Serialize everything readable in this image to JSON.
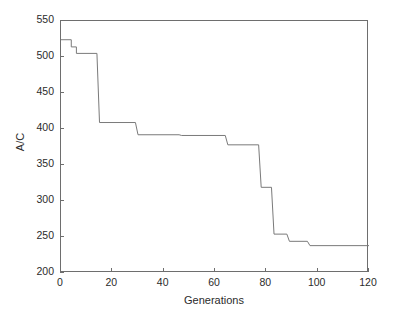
{
  "chart_data": {
    "type": "line",
    "title": "",
    "xlabel": "Generations",
    "ylabel": "A/C",
    "xlim": [
      0,
      120
    ],
    "ylim": [
      200,
      550
    ],
    "xticks": [
      0,
      20,
      40,
      60,
      80,
      100,
      120
    ],
    "yticks": [
      200,
      250,
      300,
      350,
      400,
      450,
      500,
      550
    ],
    "grid": false,
    "legend": null,
    "line_color": "#7a7a7a",
    "axis_color": "#6e6e6e",
    "background_color": "#ffffff",
    "step_style": "post",
    "series": [
      {
        "name": "Best A/C per generation",
        "x": [
          0,
          4,
          4,
          6,
          6,
          14,
          14,
          15,
          15,
          29,
          29,
          30,
          30,
          46,
          46,
          47,
          47,
          64,
          64,
          65,
          65,
          77,
          77,
          78,
          78,
          82,
          82,
          83,
          83,
          88,
          88,
          89,
          89,
          96,
          96,
          97,
          97,
          120
        ],
        "y": [
          524,
          524,
          514,
          514,
          505,
          505,
          505,
          409,
          409,
          409,
          409,
          392,
          392,
          392,
          392,
          391,
          391,
          391,
          391,
          378,
          378,
          378,
          378,
          319,
          319,
          319,
          319,
          254,
          254,
          254,
          254,
          244,
          244,
          244,
          244,
          238,
          238,
          238
        ],
        "points": [
          {
            "generation": 0,
            "ac": 524
          },
          {
            "generation": 4,
            "ac": 524
          },
          {
            "generation": 6,
            "ac": 505
          },
          {
            "generation": 14,
            "ac": 505
          },
          {
            "generation": 15,
            "ac": 409
          },
          {
            "generation": 29,
            "ac": 409
          },
          {
            "generation": 30,
            "ac": 392
          },
          {
            "generation": 46,
            "ac": 392
          },
          {
            "generation": 47,
            "ac": 391
          },
          {
            "generation": 64,
            "ac": 391
          },
          {
            "generation": 65,
            "ac": 378
          },
          {
            "generation": 77,
            "ac": 378
          },
          {
            "generation": 78,
            "ac": 319
          },
          {
            "generation": 82,
            "ac": 319
          },
          {
            "generation": 83,
            "ac": 254
          },
          {
            "generation": 88,
            "ac": 254
          },
          {
            "generation": 89,
            "ac": 244
          },
          {
            "generation": 96,
            "ac": 244
          },
          {
            "generation": 97,
            "ac": 238
          },
          {
            "generation": 120,
            "ac": 238
          }
        ]
      }
    ]
  },
  "axes": {
    "x_label": "Generations",
    "y_label": "A/C",
    "x_tick_labels": [
      "0",
      "20",
      "40",
      "60",
      "80",
      "100",
      "120"
    ],
    "y_tick_labels": [
      "200",
      "250",
      "300",
      "350",
      "400",
      "450",
      "500",
      "550"
    ]
  }
}
